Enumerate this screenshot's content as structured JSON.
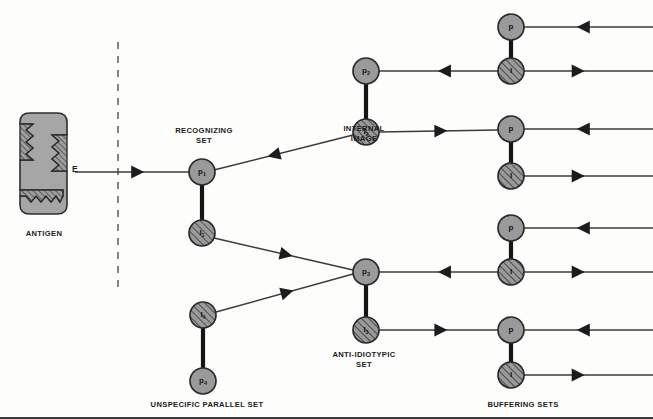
{
  "figure": {
    "background": "#fdfdfc",
    "colors": {
      "node_fill": "#9a9a9a",
      "node_stroke": "#2b2b2b",
      "hatch_fill": "#9a9a9a",
      "antigen_fill": "#a6a6a6",
      "line": "#3b3b3b",
      "dashed_divider": "#777777",
      "text": "#1d1d1d"
    }
  },
  "antigen": {
    "label": "ANTIGEN",
    "epitope_label": "E"
  },
  "divider": {
    "name": "dashed-boundary",
    "x": 118,
    "y_top": 42,
    "y_bottom": 293,
    "dash": "7 7"
  },
  "group_labels": [
    {
      "id": "recognizing-set",
      "text": "RECOGNIZING\nSET",
      "x": 204,
      "y": 126
    },
    {
      "id": "internal-image",
      "text": "INTERNAL\nIMAGE",
      "x": 364,
      "y": 124
    },
    {
      "id": "anti-idiotypic-set",
      "text": "ANTI-IDIOTYPIC\nSET",
      "x": 364,
      "y": 350
    },
    {
      "id": "unspecific-parallel",
      "text": "UNSPECIFIC PARALLEL SET",
      "x": 207,
      "y": 400
    },
    {
      "id": "buffering-sets",
      "text": "BUFFERING SETS",
      "x": 523,
      "y": 400
    },
    {
      "id": "antigen-caption",
      "text": "ANTIGEN",
      "x": 44,
      "y": 229
    }
  ],
  "nodes": [
    {
      "id": "p1",
      "label": "p",
      "sub": "1",
      "type": "plain",
      "cx": 202,
      "cy": 172,
      "r": 13,
      "group": "recognizing-set"
    },
    {
      "id": "i1",
      "label": "I",
      "sub": "1",
      "type": "hatched",
      "cx": 202,
      "cy": 233,
      "r": 13,
      "group": "recognizing-set"
    },
    {
      "id": "i4",
      "label": "I",
      "sub": "4",
      "type": "hatched",
      "cx": 203,
      "cy": 315,
      "r": 13,
      "group": "unspecific-parallel"
    },
    {
      "id": "p4",
      "label": "p",
      "sub": "4",
      "type": "plain",
      "cx": 203,
      "cy": 381,
      "r": 13,
      "group": "unspecific-parallel"
    },
    {
      "id": "p2",
      "label": "p",
      "sub": "2",
      "type": "plain",
      "cx": 366,
      "cy": 71,
      "r": 13,
      "group": "internal-image"
    },
    {
      "id": "i2",
      "label": "I",
      "sub": "2",
      "type": "hatched",
      "cx": 366,
      "cy": 132,
      "r": 13,
      "group": "internal-image"
    },
    {
      "id": "p3",
      "label": "p",
      "sub": "3",
      "type": "plain",
      "cx": 366,
      "cy": 272,
      "r": 13,
      "group": "anti-idiotypic-set"
    },
    {
      "id": "i3",
      "label": "I",
      "sub": "3",
      "type": "hatched",
      "cx": 366,
      "cy": 330,
      "r": 13,
      "group": "anti-idiotypic-set"
    },
    {
      "id": "b1p",
      "label": "p",
      "sub": "",
      "type": "plain",
      "cx": 511,
      "cy": 27,
      "r": 13,
      "group": "buffering-sets"
    },
    {
      "id": "b1i",
      "label": "I",
      "sub": "",
      "type": "hatched",
      "cx": 511,
      "cy": 71,
      "r": 13,
      "group": "buffering-sets"
    },
    {
      "id": "b2p",
      "label": "p",
      "sub": "",
      "type": "plain",
      "cx": 511,
      "cy": 129,
      "r": 13,
      "group": "buffering-sets"
    },
    {
      "id": "b2i",
      "label": "I",
      "sub": "",
      "type": "hatched",
      "cx": 511,
      "cy": 176,
      "r": 13,
      "group": "buffering-sets"
    },
    {
      "id": "b3p",
      "label": "p",
      "sub": "",
      "type": "plain",
      "cx": 511,
      "cy": 228,
      "r": 13,
      "group": "buffering-sets"
    },
    {
      "id": "b3i",
      "label": "I",
      "sub": "",
      "type": "hatched",
      "cx": 511,
      "cy": 272,
      "r": 13,
      "group": "buffering-sets"
    },
    {
      "id": "b4p",
      "label": "p",
      "sub": "",
      "type": "plain",
      "cx": 511,
      "cy": 330,
      "r": 13,
      "group": "buffering-sets"
    },
    {
      "id": "b4i",
      "label": "I",
      "sub": "",
      "type": "hatched",
      "cx": 511,
      "cy": 375,
      "r": 13,
      "group": "buffering-sets"
    }
  ],
  "thick_links": [
    {
      "id": "link-p1-i1",
      "x1": 202,
      "y1": 185,
      "x2": 202,
      "y2": 220
    },
    {
      "id": "link-i4-p4",
      "x1": 203,
      "y1": 328,
      "x2": 203,
      "y2": 368
    },
    {
      "id": "link-p2-i2",
      "x1": 366,
      "y1": 84,
      "x2": 366,
      "y2": 119
    },
    {
      "id": "link-p3-i3",
      "x1": 366,
      "y1": 285,
      "x2": 366,
      "y2": 317
    },
    {
      "id": "link-b1",
      "x1": 511,
      "y1": 40,
      "x2": 511,
      "y2": 58
    },
    {
      "id": "link-b2",
      "x1": 511,
      "y1": 142,
      "x2": 511,
      "y2": 163
    },
    {
      "id": "link-b3",
      "x1": 511,
      "y1": 241,
      "x2": 511,
      "y2": 259
    },
    {
      "id": "link-b4",
      "x1": 511,
      "y1": 343,
      "x2": 511,
      "y2": 362
    }
  ],
  "arrows": [
    {
      "id": "arrow-antigen-to-p1",
      "x1": 75,
      "y1": 172,
      "x2": 189,
      "y2": 172,
      "head_at": 0.55,
      "dir": "forward"
    },
    {
      "id": "arrow-i2-to-p1",
      "x1": 353,
      "y1": 135,
      "x2": 214,
      "y2": 170,
      "head_at": 0.57,
      "dir": "forward"
    },
    {
      "id": "arrow-i1-to-p3",
      "x1": 214,
      "y1": 238,
      "x2": 353,
      "y2": 270,
      "head_at": 0.52,
      "dir": "forward"
    },
    {
      "id": "arrow-i4-to-p3",
      "x1": 216,
      "y1": 312,
      "x2": 353,
      "y2": 274,
      "head_at": 0.52,
      "dir": "forward"
    },
    {
      "id": "arrow-b1p-row",
      "x1": 524,
      "y1": 27,
      "x2": 653,
      "y2": 27,
      "head_at": 0.46,
      "dir": "backward"
    },
    {
      "id": "arrow-p2-to-b1i",
      "x1": 379,
      "y1": 71,
      "x2": 498,
      "y2": 71,
      "head_at": 0.55,
      "dir": "backward"
    },
    {
      "id": "arrow-b1i-row",
      "x1": 524,
      "y1": 71,
      "x2": 653,
      "y2": 71,
      "head_at": 0.42,
      "dir": "forward"
    },
    {
      "id": "arrow-b2p-row",
      "x1": 524,
      "y1": 129,
      "x2": 653,
      "y2": 129,
      "head_at": 0.46,
      "dir": "backward"
    },
    {
      "id": "arrow-i2-to-b2p",
      "x1": 379,
      "y1": 132,
      "x2": 498,
      "y2": 130,
      "head_at": 0.52,
      "dir": "forward"
    },
    {
      "id": "arrow-b2i-row",
      "x1": 524,
      "y1": 176,
      "x2": 653,
      "y2": 176,
      "head_at": 0.42,
      "dir": "forward"
    },
    {
      "id": "arrow-b3p-row",
      "x1": 524,
      "y1": 228,
      "x2": 653,
      "y2": 228,
      "head_at": 0.46,
      "dir": "backward"
    },
    {
      "id": "arrow-p3-to-b3i",
      "x1": 379,
      "y1": 272,
      "x2": 498,
      "y2": 272,
      "head_at": 0.55,
      "dir": "backward"
    },
    {
      "id": "arrow-b3i-row",
      "x1": 524,
      "y1": 272,
      "x2": 653,
      "y2": 272,
      "head_at": 0.42,
      "dir": "forward"
    },
    {
      "id": "arrow-b4p-row",
      "x1": 524,
      "y1": 330,
      "x2": 653,
      "y2": 330,
      "head_at": 0.46,
      "dir": "backward"
    },
    {
      "id": "arrow-i3-to-b4p",
      "x1": 379,
      "y1": 330,
      "x2": 498,
      "y2": 330,
      "head_at": 0.52,
      "dir": "forward"
    },
    {
      "id": "arrow-b4i-row",
      "x1": 524,
      "y1": 375,
      "x2": 653,
      "y2": 375,
      "head_at": 0.42,
      "dir": "forward"
    }
  ]
}
